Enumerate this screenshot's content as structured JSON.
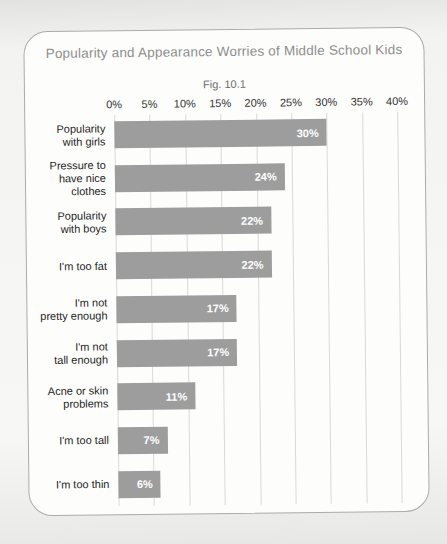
{
  "chart_data": {
    "type": "bar",
    "orientation": "horizontal",
    "title": "Popularity and Appearance Worries of Middle School Kids",
    "subtitle": "Fig. 10.1",
    "categories": [
      "Popularity with girls",
      "Pressure to have nice clothes",
      "Popularity with boys",
      "I'm too fat",
      "I'm not pretty enough",
      "I'm not tall enough",
      "Acne or skin problems",
      "I'm too tall",
      "I'm too thin"
    ],
    "category_lines": [
      "Popularity\nwith girls",
      "Pressure to\nhave nice\nclothes",
      "Popularity\nwith boys",
      "I'm too fat",
      "I'm not\npretty enough",
      "I'm not\ntall enough",
      "Acne or skin\nproblems",
      "I'm too tall",
      "I'm too thin"
    ],
    "values": [
      30,
      24,
      22,
      22,
      17,
      17,
      11,
      7,
      6
    ],
    "value_labels": [
      "30%",
      "24%",
      "22%",
      "22%",
      "17%",
      "17%",
      "11%",
      "7%",
      "6%"
    ],
    "xlim": [
      0,
      40
    ],
    "xticks": [
      0,
      5,
      10,
      15,
      20,
      25,
      30,
      35,
      40
    ],
    "xticklabels": [
      "0%",
      "5%",
      "10%",
      "15%",
      "20%",
      "25%",
      "30%",
      "35%",
      "40%"
    ],
    "grid": "vertical",
    "legend": "none",
    "xlabel": "",
    "ylabel": "",
    "colors": {
      "bar": "#9d9d9d",
      "value_label": "#ffffff",
      "gridline": "#d9d9d9",
      "title": "#8e8e8e",
      "subtitle": "#6b6b6b",
      "axis_label": "#303030",
      "category_label": "#1d1d1d",
      "frame_border": "#ababab",
      "frame_background": "#fdfdfc"
    }
  }
}
